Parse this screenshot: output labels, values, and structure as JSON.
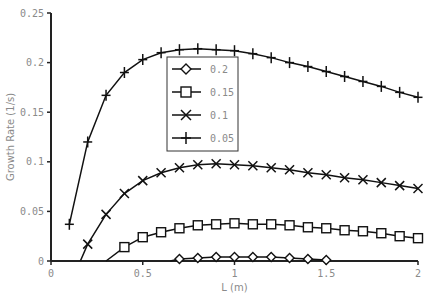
{
  "chart_data": {
    "type": "line",
    "title": "",
    "xlabel": "L (m)",
    "ylabel": "Growth Rate (1/s)",
    "xlim": [
      0,
      2
    ],
    "ylim": [
      0,
      0.25
    ],
    "xticks": [
      "0",
      "0.5",
      "1",
      "1.5",
      "2"
    ],
    "yticks": [
      "0",
      "0.05",
      "0.1",
      "0.15",
      "0.2",
      "0.25"
    ],
    "grid": false,
    "legend_position": "upper-center inside plot",
    "series": [
      {
        "name": "0.2",
        "marker": "diamond",
        "x": [
          0.7,
          0.8,
          0.9,
          1.0,
          1.1,
          1.2,
          1.3,
          1.4,
          1.5
        ],
        "values": [
          0.002,
          0.003,
          0.004,
          0.004,
          0.004,
          0.004,
          0.003,
          0.002,
          0.001
        ],
        "line_start": [
          0.65,
          0
        ]
      },
      {
        "name": "0.15",
        "marker": "square",
        "x": [
          0.4,
          0.5,
          0.6,
          0.7,
          0.8,
          0.9,
          1.0,
          1.1,
          1.2,
          1.3,
          1.4,
          1.5,
          1.6,
          1.7,
          1.8,
          1.9,
          2.0
        ],
        "values": [
          0.014,
          0.024,
          0.029,
          0.033,
          0.036,
          0.037,
          0.038,
          0.037,
          0.037,
          0.036,
          0.034,
          0.033,
          0.031,
          0.03,
          0.028,
          0.025,
          0.023
        ],
        "line_start": [
          0.3,
          0
        ]
      },
      {
        "name": "0.1",
        "marker": "x",
        "x": [
          0.2,
          0.3,
          0.4,
          0.5,
          0.6,
          0.7,
          0.8,
          0.9,
          1.0,
          1.1,
          1.2,
          1.3,
          1.4,
          1.5,
          1.6,
          1.7,
          1.8,
          1.9,
          2.0
        ],
        "values": [
          0.017,
          0.047,
          0.068,
          0.081,
          0.089,
          0.094,
          0.097,
          0.098,
          0.097,
          0.096,
          0.094,
          0.092,
          0.089,
          0.087,
          0.084,
          0.082,
          0.079,
          0.076,
          0.073
        ],
        "line_start": [
          0.16,
          0
        ]
      },
      {
        "name": "0.05",
        "marker": "plus",
        "x": [
          0.1,
          0.2,
          0.3,
          0.4,
          0.5,
          0.6,
          0.7,
          0.8,
          0.9,
          1.0,
          1.1,
          1.2,
          1.3,
          1.4,
          1.5,
          1.6,
          1.7,
          1.8,
          1.9,
          2.0
        ],
        "values": [
          0.037,
          0.12,
          0.167,
          0.19,
          0.203,
          0.21,
          0.213,
          0.214,
          0.213,
          0.212,
          0.209,
          0.205,
          0.2,
          0.196,
          0.191,
          0.186,
          0.181,
          0.176,
          0.17,
          0.165
        ],
        "line_start": null
      }
    ]
  }
}
